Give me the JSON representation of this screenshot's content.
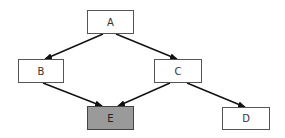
{
  "diagram": {
    "type": "directed-graph",
    "nodes": [
      {
        "id": "A",
        "label": "A",
        "x": 87,
        "y": 10,
        "w": 47,
        "h": 24,
        "fill": "#ffffff"
      },
      {
        "id": "B",
        "label": "B",
        "x": 18,
        "y": 59,
        "w": 46,
        "h": 24,
        "fill": "#ffffff"
      },
      {
        "id": "C",
        "label": "C",
        "x": 154,
        "y": 59,
        "w": 48,
        "h": 24,
        "fill": "#ffffff"
      },
      {
        "id": "E",
        "label": "E",
        "x": 87,
        "y": 106,
        "w": 47,
        "h": 24,
        "fill": "#9a9a9a",
        "highlighted": true
      },
      {
        "id": "D",
        "label": "D",
        "x": 222,
        "y": 107,
        "w": 48,
        "h": 23,
        "fill": "#ffffff"
      }
    ],
    "edges": [
      {
        "from": "A",
        "to": "B"
      },
      {
        "from": "A",
        "to": "C"
      },
      {
        "from": "B",
        "to": "E"
      },
      {
        "from": "C",
        "to": "E"
      },
      {
        "from": "C",
        "to": "D"
      }
    ],
    "colors": {
      "edge": "#111111",
      "node_border": "#555555",
      "highlight_fill": "#9a9a9a"
    }
  }
}
